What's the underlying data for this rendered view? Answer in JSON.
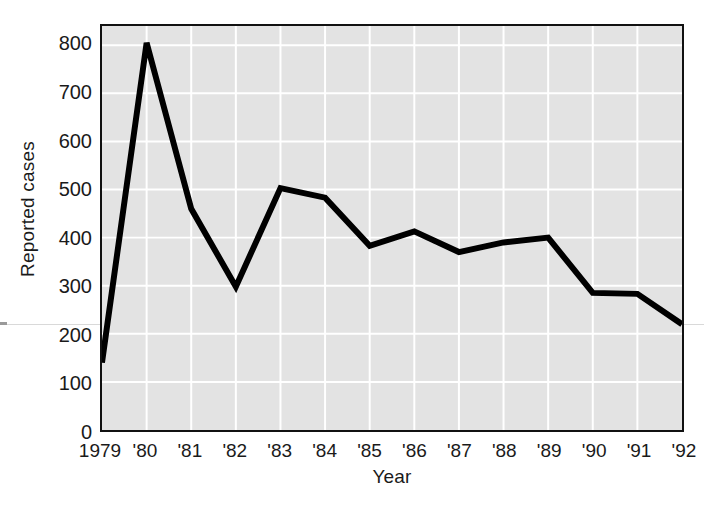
{
  "chart_data": {
    "type": "line",
    "title": "",
    "xlabel": "Year",
    "ylabel": "Reported cases",
    "categories": [
      "1979",
      "'80",
      "'81",
      "'82",
      "'83",
      "'84",
      "'85",
      "'86",
      "'87",
      "'88",
      "'89",
      "'90",
      "'91",
      "'92"
    ],
    "x_values": [
      1979,
      1980,
      1981,
      1982,
      1983,
      1984,
      1985,
      1986,
      1987,
      1988,
      1989,
      1990,
      1991,
      1992
    ],
    "values": [
      140,
      805,
      460,
      298,
      503,
      483,
      383,
      413,
      370,
      390,
      400,
      285,
      283,
      220
    ],
    "series": [
      {
        "name": "Reported cases",
        "values": [
          140,
          805,
          460,
          298,
          503,
          483,
          383,
          413,
          370,
          390,
          400,
          285,
          283,
          220
        ]
      }
    ],
    "ylim": [
      0,
      840
    ],
    "xlim": [
      1979,
      1992
    ],
    "y_ticks": [
      0,
      100,
      200,
      300,
      400,
      500,
      600,
      700,
      800
    ],
    "y_tick_labels": [
      "0",
      "100",
      "200",
      "300",
      "400",
      "500",
      "600",
      "700",
      "800"
    ],
    "grid": true,
    "grid_color": "#ffffff",
    "plot_background": "#e3e3e3",
    "line_color": "#000000",
    "line_width": 6,
    "legend": "none",
    "markers": "none"
  },
  "axes": {
    "y_title": "Reported cases",
    "x_title": "Year"
  }
}
